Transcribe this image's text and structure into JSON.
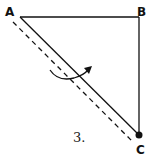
{
  "diagram": {
    "figure_number": "3.",
    "vertices": [
      {
        "label": "A",
        "x": 20,
        "y": 17
      },
      {
        "label": "B",
        "x": 139,
        "y": 17
      },
      {
        "label": "C",
        "x": 139,
        "y": 135
      }
    ],
    "edges": [
      {
        "from": "A",
        "to": "B",
        "style": "solid"
      },
      {
        "from": "B",
        "to": "C",
        "style": "solid"
      },
      {
        "from": "A",
        "to": "C",
        "style": "solid"
      }
    ],
    "fold_line": {
      "style": "dashed",
      "description": "axis parallel to AC"
    },
    "rotation_arrow": {
      "direction": "curved arrow across AC"
    },
    "point_marker": {
      "at": "C",
      "style": "filled-dot"
    },
    "colors": {
      "stroke": "#111111",
      "background": "#ffffff"
    }
  }
}
